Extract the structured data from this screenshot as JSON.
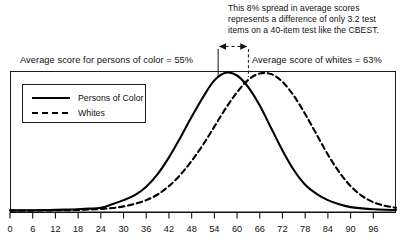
{
  "annotations": {
    "callout": "This 8% spread in average scores\nrepresents a difference of only 3.2 test\nitems on a 40-item test like the CBEST.",
    "label_persons_of_color": "Average score for persons of color = 55%",
    "label_whites": "Average score of whites = 63%"
  },
  "legend": {
    "items": [
      {
        "label": "Persons of Color",
        "style": "solid"
      },
      {
        "label": "Whites",
        "style": "dashed"
      }
    ]
  },
  "axis": {
    "ticks": [
      "0",
      "6",
      "12",
      "18",
      "24",
      "30",
      "36",
      "42",
      "48",
      "54",
      "60",
      "66",
      "72",
      "78",
      "84",
      "90",
      "96"
    ]
  },
  "colors": {
    "line": "#000000",
    "frame": "#1a1a1a",
    "text": "#111111",
    "background": "#ffffff"
  },
  "chart_data": {
    "type": "line",
    "title": "",
    "subtitle": "",
    "xlabel": "",
    "ylabel": "",
    "xlim": [
      0,
      102
    ],
    "ylim": [
      0,
      1
    ],
    "grid": false,
    "legend_position": "upper-left-inside",
    "x": [
      0,
      3,
      6,
      9,
      12,
      15,
      18,
      21,
      24,
      27,
      30,
      33,
      36,
      39,
      42,
      45,
      48,
      51,
      54,
      57,
      60,
      63,
      66,
      69,
      72,
      75,
      78,
      81,
      84,
      87,
      90,
      93,
      96,
      99,
      102
    ],
    "series": [
      {
        "name": "Persons of Color",
        "style": "solid",
        "mean": 55,
        "peak_value": 1.0,
        "values": [
          0.012,
          0.012,
          0.013,
          0.014,
          0.015,
          0.017,
          0.02,
          0.024,
          0.03,
          0.055,
          0.085,
          0.12,
          0.18,
          0.27,
          0.39,
          0.53,
          0.68,
          0.82,
          0.94,
          0.995,
          0.975,
          0.89,
          0.76,
          0.6,
          0.44,
          0.3,
          0.195,
          0.13,
          0.085,
          0.055,
          0.035,
          0.026,
          0.02,
          0.016,
          0.014
        ]
      },
      {
        "name": "Whites",
        "style": "dashed",
        "mean": 63,
        "peak_value": 0.99,
        "values": [
          0.01,
          0.01,
          0.01,
          0.011,
          0.012,
          0.013,
          0.015,
          0.018,
          0.022,
          0.028,
          0.04,
          0.058,
          0.085,
          0.125,
          0.185,
          0.265,
          0.365,
          0.48,
          0.61,
          0.74,
          0.855,
          0.945,
          0.99,
          0.985,
          0.93,
          0.83,
          0.7,
          0.555,
          0.41,
          0.285,
          0.185,
          0.115,
          0.07,
          0.045,
          0.03
        ]
      }
    ],
    "annotations": [
      {
        "text": "Average score for persons of color = 55%",
        "x": 55,
        "type": "mean-marker"
      },
      {
        "text": "Average score of whites = 63%",
        "x": 63,
        "type": "mean-marker"
      },
      {
        "text": "This 8% spread in average scores represents a difference of only 3.2 test items on a 40-item test like the CBEST.",
        "from_x": 55,
        "to_x": 63,
        "type": "span-arrow"
      }
    ]
  }
}
